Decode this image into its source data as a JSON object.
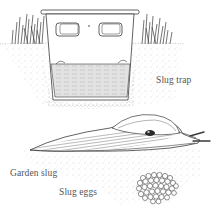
{
  "illustration": {
    "labels": {
      "trap": "Slug trap",
      "slug": "Garden slug",
      "eggs": "Slug eggs"
    },
    "colors": {
      "ink": "#3a3a3a",
      "soil_speckle": "#9a9a9a",
      "liquid": "#d9d9d9",
      "background": "#ffffff"
    }
  }
}
